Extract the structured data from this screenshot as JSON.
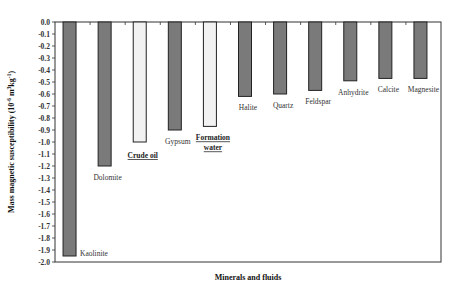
{
  "chart_data": {
    "type": "bar",
    "title": "",
    "xlabel": "Minerals and fluids",
    "ylabel": "Mass magnetic susceptibility (10⁻⁶ m³kg⁻¹)",
    "ylim": [
      -2.0,
      0.0
    ],
    "yticks": [
      "0.0",
      "-0.1",
      "-0.2",
      "-0.3",
      "-0.4",
      "-0.5",
      "-0.6",
      "-0.7",
      "-0.8",
      "-0.9",
      "-1.0",
      "-1.1",
      "-1.2",
      "-1.3",
      "-1.4",
      "-1.5",
      "-1.6",
      "-1.7",
      "-1.8",
      "-1.9",
      "-2.0"
    ],
    "grid": false,
    "categories": [
      "Kaolinite",
      "Dolomite",
      "Crude oil",
      "Gypsum",
      "Formation water",
      "Halite",
      "Quartz",
      "Feldspar",
      "Anhydrite",
      "Calcite",
      "Magnesite"
    ],
    "values": [
      -1.95,
      -1.2,
      -1.0,
      -0.9,
      -0.87,
      -0.62,
      -0.6,
      -0.57,
      -0.49,
      -0.47,
      -0.47
    ],
    "highlighted": [
      "Crude oil",
      "Formation water"
    ],
    "colors": {
      "mineral": "#7a7a7a",
      "fluid": "#f2f2f2",
      "edge": "#222222"
    }
  }
}
